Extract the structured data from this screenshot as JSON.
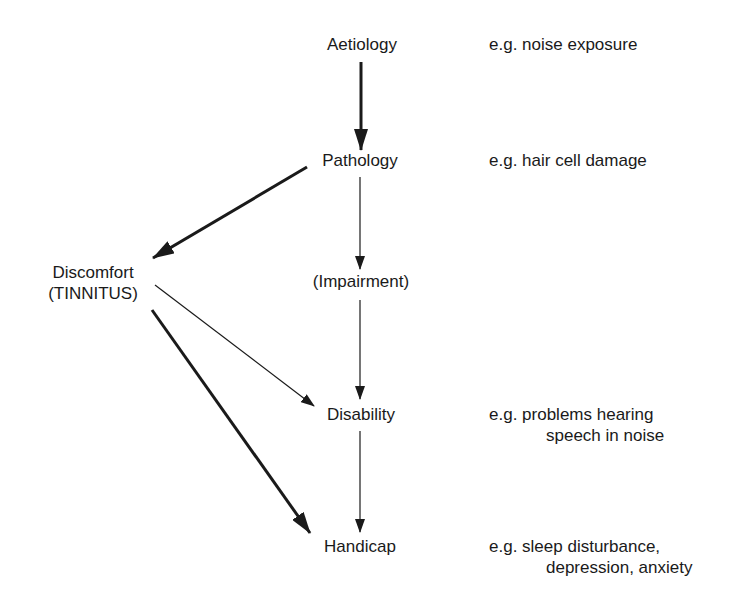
{
  "diagram": {
    "nodes": {
      "aetiology": "Aetiology",
      "pathology": "Pathology",
      "impairment": "(Impairment)",
      "disability": "Disability",
      "handicap": "Handicap",
      "discomfort_line1": "Discomfort",
      "discomfort_line2": "(TINNITUS)"
    },
    "examples": {
      "aetiology": "e.g. noise exposure",
      "pathology": "e.g. hair cell damage",
      "disability_line1": "e.g. problems hearing",
      "disability_line2": "speech in noise",
      "handicap_line1": "e.g. sleep disturbance,",
      "handicap_line2": "depression, anxiety"
    },
    "edges": [
      {
        "from": "Aetiology",
        "to": "Pathology",
        "weight": "thick"
      },
      {
        "from": "Pathology",
        "to": "Discomfort (TINNITUS)",
        "weight": "thick"
      },
      {
        "from": "Pathology",
        "to": "(Impairment)",
        "weight": "thin"
      },
      {
        "from": "(Impairment)",
        "to": "Disability",
        "weight": "thin"
      },
      {
        "from": "Discomfort (TINNITUS)",
        "to": "Disability",
        "weight": "thin"
      },
      {
        "from": "Disability",
        "to": "Handicap",
        "weight": "thin"
      },
      {
        "from": "Discomfort (TINNITUS)",
        "to": "Handicap",
        "weight": "thick"
      }
    ]
  }
}
